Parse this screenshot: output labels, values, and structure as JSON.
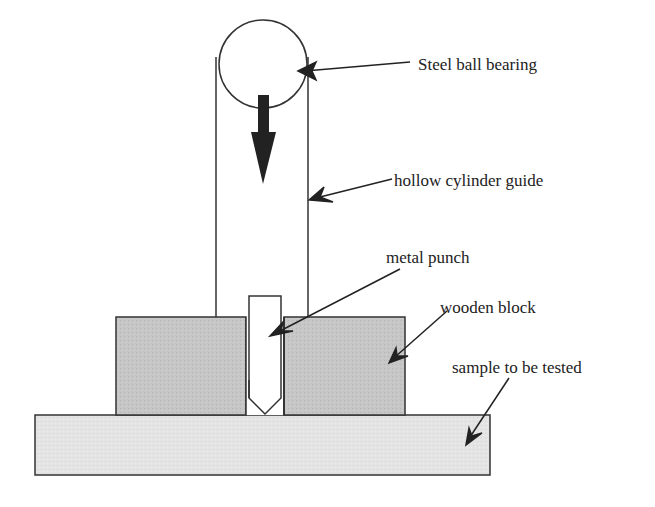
{
  "diagram": {
    "colors": {
      "line": "#333333",
      "block_fill": "#c4c4c4",
      "sample_fill": "#e3e3e3",
      "arrow_fill": "#222222",
      "background": "#ffffff"
    },
    "labels": {
      "steel_ball": "Steel ball bearing",
      "cylinder": "hollow cylinder guide",
      "punch": "metal punch",
      "wooden_block": "wooden block",
      "sample": "sample to be tested"
    }
  }
}
